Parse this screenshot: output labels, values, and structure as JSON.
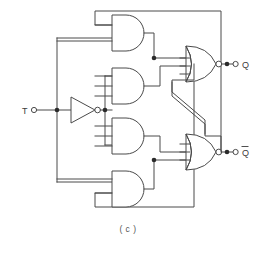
{
  "figure": {
    "caption": "( c )",
    "title_alt": "T flip-flop logic diagram"
  },
  "pins": {
    "input": {
      "name": "T",
      "label": "T",
      "terminal_icon": "open-circle-terminal"
    },
    "outputs": [
      {
        "name": "Q",
        "label": "Q",
        "overbar": false,
        "terminal_icon": "open-circle-terminal"
      },
      {
        "name": "Q-not",
        "label": "Q",
        "overbar": true,
        "terminal_icon": "open-circle-terminal"
      }
    ]
  },
  "gates": [
    {
      "id": "and-1",
      "type": "AND",
      "inputs": 2,
      "position": "top"
    },
    {
      "id": "and-2",
      "type": "AND",
      "inputs": 3,
      "position": "upper-middle"
    },
    {
      "id": "and-3",
      "type": "AND",
      "inputs": 3,
      "position": "lower-middle"
    },
    {
      "id": "and-4",
      "type": "AND",
      "inputs": 2,
      "position": "bottom"
    },
    {
      "id": "nor-1",
      "type": "NOR",
      "inputs": 3,
      "position": "right-upper",
      "drives": "Q"
    },
    {
      "id": "nor-2",
      "type": "NOR",
      "inputs": 3,
      "position": "right-lower",
      "drives": "Q-not"
    },
    {
      "id": "inv-1",
      "type": "INVERTER",
      "inputs": 1,
      "position": "left-middle"
    }
  ],
  "junctions": [
    {
      "id": "j-t-bus",
      "x": 57,
      "y": 110
    },
    {
      "id": "j-inv-out",
      "x": 95,
      "y": 110
    },
    {
      "id": "j-and1-out",
      "x": 154,
      "y": 58
    },
    {
      "id": "j-and4-out",
      "x": 154,
      "y": 160
    },
    {
      "id": "j-q",
      "x": 221,
      "y": 64
    },
    {
      "id": "j-qnot",
      "x": 221,
      "y": 152
    }
  ],
  "colors": {
    "wire": "#4a4a4a",
    "gate_fill": "#ffffff",
    "junction": "#2b2b2b",
    "label": "#3c3c3c",
    "caption": "#555555",
    "background": "#ffffff"
  }
}
